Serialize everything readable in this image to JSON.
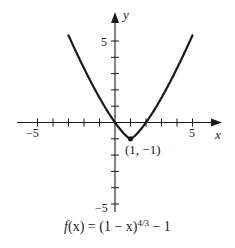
{
  "chart_data": {
    "type": "line",
    "title": "",
    "caption": "f(x) = (1 − x)^{4/3} − 1",
    "function": "f(x) = (1 - x)^(4/3) - 1",
    "xlabel": "x",
    "ylabel": "y",
    "xlim": [
      -6.3,
      6.8
    ],
    "ylim": [
      -6.0,
      6.7
    ],
    "x_ticks": [
      -5,
      -4,
      -3,
      -2,
      -1,
      1,
      2,
      3,
      4,
      5
    ],
    "y_ticks": [
      -5,
      -4,
      -3,
      -2,
      -1,
      1,
      2,
      3,
      4,
      5
    ],
    "x_tick_labels": [
      {
        "value": -5,
        "label": "−5"
      },
      {
        "value": 5,
        "label": "5"
      }
    ],
    "y_tick_labels": [
      {
        "value": 5,
        "label": "5"
      },
      {
        "value": -5,
        "label": "−5"
      }
    ],
    "grid": false,
    "legend": null,
    "series": [
      {
        "name": "f(x)",
        "x": [
          -3,
          -2.5,
          -2,
          -1.5,
          -1,
          -0.5,
          0,
          0.25,
          0.5,
          0.75,
          1,
          1.25,
          1.5,
          1.75,
          2,
          2.5,
          3,
          3.5,
          4,
          4.5,
          5
        ],
        "y": [
          5.35,
          4.32,
          3.33,
          2.39,
          1.52,
          0.72,
          0,
          -0.32,
          -0.6,
          -0.84,
          -1,
          -0.84,
          -0.6,
          -0.32,
          0,
          0.72,
          1.52,
          2.39,
          3.33,
          4.32,
          5.35
        ]
      }
    ],
    "annotations": [
      {
        "x": 1,
        "y": -1,
        "text": "(1, −1)",
        "marker": "point"
      }
    ]
  },
  "labels": {
    "x_axis": "x",
    "y_axis": "y",
    "x_tick_neg5": "−5",
    "x_tick_5": "5",
    "y_tick_5": "5",
    "y_tick_neg5": "−5",
    "point": "(1, −1)",
    "caption_prefix": "f",
    "caption_mid": "(x) = (1 − x)",
    "caption_exp": "4/3",
    "caption_suffix": " − 1"
  },
  "colors": {
    "axis": "#1a1a1a",
    "curve": "#1a1a1a",
    "background": "#ffffff"
  }
}
